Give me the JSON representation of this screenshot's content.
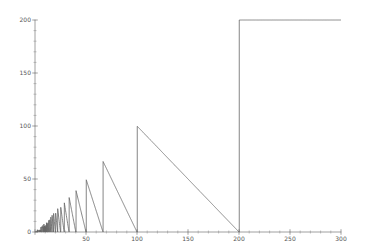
{
  "chart_data": {
    "type": "line",
    "title": "",
    "xlabel": "",
    "ylabel": "",
    "function": "y = 200 mod x",
    "xlim": [
      0,
      300
    ],
    "ylim": [
      0,
      200
    ],
    "x_ticks": [
      0,
      50,
      100,
      150,
      200,
      250,
      300
    ],
    "y_ticks": [
      0,
      50,
      100,
      150,
      200
    ],
    "x_minor_step": 10,
    "y_minor_step": 10,
    "grid": false,
    "line_color": "#666666",
    "axis_color": "#888888",
    "samples_step": 0.25
  },
  "layout": {
    "origin_px": [
      35,
      232
    ],
    "x_px_per_unit": 1.02,
    "y_px_per_unit": 1.06
  }
}
